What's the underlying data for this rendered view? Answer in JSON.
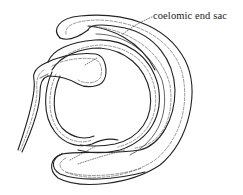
{
  "figure": {
    "labels": [
      {
        "text": "coelomic end sac",
        "target": "end-sac"
      }
    ],
    "colors": {
      "line": "#222222",
      "background": "#ffffff"
    }
  }
}
